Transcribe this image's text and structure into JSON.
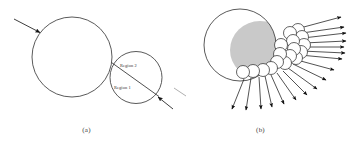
{
  "figure": {
    "background_color": "#ffffff",
    "stroke_color": "#3c3c3c",
    "shade_color": "#c9c9c9",
    "arrow_color": "#1a1a1a"
  },
  "panels": [
    {
      "id": "a",
      "caption": "(a)",
      "shapes": {
        "large_circle": {
          "cx": 72,
          "cy": 57,
          "r": 40
        },
        "small_circle": {
          "cx": 136,
          "cy": 77.5,
          "r": 26
        },
        "chord_label_upper": "Region 2",
        "chord_label_lower": "Region 1"
      },
      "arrows": [
        {
          "name": "incoming-arrow-upper-left",
          "direction": "down-right"
        },
        {
          "name": "incoming-arrow-lower-right",
          "direction": "up-left"
        }
      ]
    },
    {
      "id": "b",
      "caption": "(b)",
      "shapes": {
        "large_circle": {
          "cx": 66,
          "cy": 45,
          "r": 36
        },
        "shaded_crescent": true,
        "small_circle_count": 17
      },
      "arrows": {
        "name": "scattering-arrows",
        "count": 17,
        "description": "arrows radiating outward to the right and downward"
      }
    }
  ],
  "labels": {
    "region_2": "Region 2",
    "region_1": "Region 1",
    "caption_a": "(a)",
    "caption_b": "(b)"
  }
}
